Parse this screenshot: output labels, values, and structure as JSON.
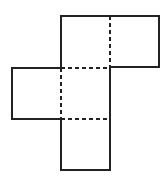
{
  "diagram": {
    "type": "cube-net",
    "colors": {
      "background": "#ffffff",
      "stroke": "#222222"
    },
    "squares": [
      {
        "name": "top-left-square",
        "x": 61,
        "y": 16,
        "size": 49
      },
      {
        "name": "top-right-square",
        "x": 110,
        "y": 16,
        "size": 49
      },
      {
        "name": "middle-left-square",
        "x": 12,
        "y": 68,
        "size": 49
      },
      {
        "name": "middle-center-square",
        "x": 61,
        "y": 68,
        "size": 49
      },
      {
        "name": "bottom-square",
        "x": 61,
        "y": 119,
        "size": 49
      }
    ],
    "fold_lines": [
      {
        "name": "fold-top-vertical",
        "x1": 110,
        "y1": 16,
        "x2": 110,
        "y2": 68
      },
      {
        "name": "fold-middle-top",
        "x1": 61,
        "y1": 68,
        "x2": 110,
        "y2": 68
      },
      {
        "name": "fold-middle-left",
        "x1": 61,
        "y1": 68,
        "x2": 61,
        "y2": 119
      },
      {
        "name": "fold-middle-bottom",
        "x1": 61,
        "y1": 119,
        "x2": 110,
        "y2": 119
      }
    ]
  }
}
